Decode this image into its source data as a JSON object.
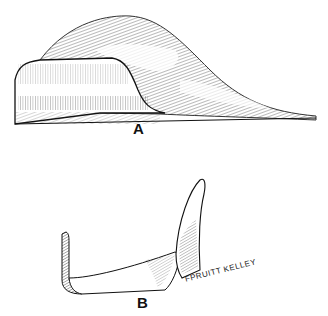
{
  "figure": {
    "panels": [
      {
        "id": "A",
        "label": "A",
        "description": "Side view of curved shell-like shape with hatching"
      },
      {
        "id": "B",
        "label": "B",
        "description": "L-shaped curved strip with upright end"
      }
    ],
    "signature": "FPRUITT KELLEY"
  },
  "colors": {
    "ink": "#111111",
    "background": "#ffffff"
  }
}
